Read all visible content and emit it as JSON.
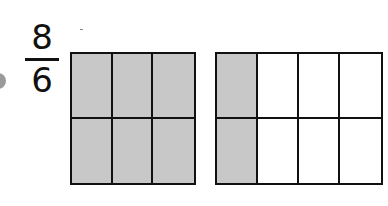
{
  "fraction": {
    "numerator": "8",
    "denominator": "6"
  },
  "models": [
    {
      "columns": 3,
      "rows": 2,
      "shaded_columns": 3,
      "left": 70,
      "width": 126
    },
    {
      "columns": 4,
      "rows": 2,
      "shaded_columns": 1,
      "left": 215,
      "width": 168
    }
  ],
  "colors": {
    "shade": "#c8c8c8",
    "line": "#111111",
    "bullet": "#9a9a9a"
  }
}
